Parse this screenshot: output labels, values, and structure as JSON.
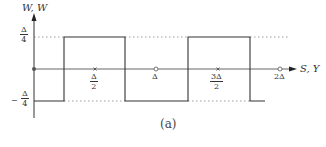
{
  "diagram": {
    "type": "square-wave-plot",
    "y_axis_label": "W, W",
    "x_axis_label": "S, Y",
    "y_levels": {
      "top": {
        "num": "Δ",
        "den": "4",
        "sign": ""
      },
      "bottom": {
        "num": "Δ",
        "den": "4",
        "sign": "−"
      }
    },
    "x_ticks": [
      {
        "label_num": "Δ",
        "label_den": "2",
        "marker": "cross"
      },
      {
        "label": "Δ",
        "marker": "circle"
      },
      {
        "label_num": "3Δ",
        "label_den": "2",
        "marker": "cross"
      },
      {
        "label": "2Δ",
        "marker": "circle"
      }
    ],
    "waveform": [
      {
        "from": "0",
        "to": "Δ/4",
        "level": "-Δ/4"
      },
      {
        "from": "Δ/4",
        "to": "3Δ/4",
        "level": "Δ/4"
      },
      {
        "from": "3Δ/4",
        "to": "5Δ/4",
        "level": "-Δ/4"
      },
      {
        "from": "5Δ/4",
        "to": "7Δ/4",
        "level": "Δ/4"
      },
      {
        "from": "7Δ/4",
        "to": "2Δ",
        "level": "-Δ/4"
      }
    ],
    "caption": "(a)",
    "colors": {
      "line": "#333333",
      "dotted": "#888888"
    }
  }
}
